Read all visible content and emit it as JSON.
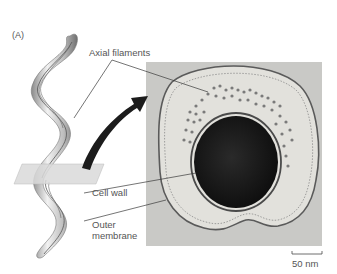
{
  "figure": {
    "panel_label": "(A)",
    "labels": {
      "axial_filaments": "Axial filaments",
      "cell_wall": "Cell wall",
      "outer_membrane_line1": "Outer",
      "outer_membrane_line2": "membrane"
    },
    "scale_bar": {
      "text": "50 nm"
    },
    "colors": {
      "micrograph_bg": "#c9c9c6",
      "protoplasm": "#1a1a1a",
      "arrow": "#1c1c1c",
      "spirochete_body": "#d4d4d4",
      "plane": "#d9d9d9"
    }
  }
}
